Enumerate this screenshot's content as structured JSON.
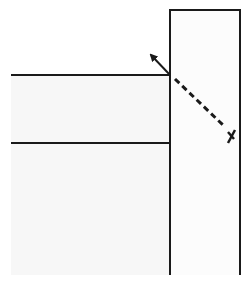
{
  "diagram": {
    "width": 249,
    "height": 285,
    "colors": {
      "background": "#ffffff",
      "stroke": "#1a1a1a",
      "left_fill": "#f7f7f7",
      "box_fill": "#fcfcfc"
    },
    "wall": {
      "x1": 170,
      "x2": 240,
      "top": 10,
      "bottom": 275
    },
    "upper_line": {
      "x1": 11,
      "x2": 170,
      "y": 75
    },
    "lower_line": {
      "x1": 11,
      "x2": 170,
      "y": 143
    },
    "reflected_arrow": {
      "from": [
        170,
        75
      ],
      "to": [
        150,
        54
      ]
    },
    "dashed_path": {
      "from": [
        175,
        79
      ],
      "to": [
        224,
        126
      ]
    },
    "x_mark": {
      "center": [
        231,
        136
      ],
      "glyph": "X"
    }
  }
}
